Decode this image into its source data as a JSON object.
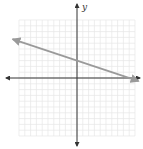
{
  "chart_data": {
    "type": "line",
    "title": "",
    "xlabel": "x",
    "ylabel": "y",
    "xlim": [
      -10,
      10
    ],
    "ylim": [
      -10,
      10
    ],
    "grid": true,
    "grid_step": 1,
    "axis_arrows": true,
    "series": [
      {
        "name": "line",
        "color": "#9a9a9a",
        "equation": "y = -x/3 + 3",
        "points": [
          [
            -11,
            6.67
          ],
          [
            0,
            3
          ],
          [
            9,
            0
          ],
          [
            10.5,
            -0.5
          ]
        ],
        "slope": -0.3333,
        "y_intercept": 3,
        "x_intercept": 9,
        "arrow_ends": true
      }
    ]
  },
  "labels": {
    "y_axis": "y",
    "x_axis": "x"
  },
  "colors": {
    "grid": "#e6e6e6",
    "axis": "#333333",
    "line": "#9a9a9a",
    "background": "#ffffff"
  }
}
